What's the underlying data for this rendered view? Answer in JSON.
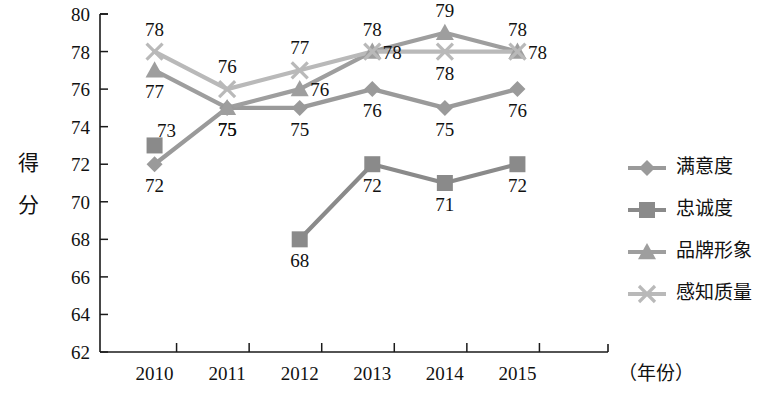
{
  "chart_data": {
    "type": "line",
    "title": "",
    "subtitle": "",
    "xlabel": "（年份）",
    "ylabel": "得分",
    "categories": [
      "2010",
      "2011",
      "2012",
      "2013",
      "2014",
      "2015"
    ],
    "ylim": [
      62,
      80
    ],
    "yticks": [
      62,
      64,
      66,
      68,
      70,
      72,
      74,
      76,
      78,
      80
    ],
    "ytick_labels": [
      "62",
      "64",
      "66",
      "68",
      "70",
      "72",
      "74",
      "76",
      "78",
      "80"
    ],
    "grid": false,
    "legend_position": "right",
    "series": [
      {
        "name": "满意度",
        "marker": "diamond",
        "color": "#9a9a9a",
        "values": [
          72,
          75,
          75,
          76,
          75,
          76
        ],
        "labels": [
          "72",
          "75",
          "75",
          "76",
          "75",
          "76"
        ]
      },
      {
        "name": "忠诚度",
        "marker": "square",
        "color": "#8a8a8a",
        "values": [
          73,
          null,
          68,
          72,
          71,
          72
        ],
        "labels": [
          "73",
          "",
          "68",
          "72",
          "71",
          "72"
        ]
      },
      {
        "name": "品牌形象",
        "marker": "triangle",
        "color": "#9e9e9e",
        "values": [
          77,
          75,
          76,
          78,
          79,
          78
        ],
        "labels": [
          "77",
          "75",
          "76",
          "78",
          "79",
          "78"
        ]
      },
      {
        "name": "感知质量",
        "marker": "cross",
        "color": "#b9b9b9",
        "values": [
          78,
          76,
          77,
          78,
          78,
          78
        ],
        "labels": [
          "78",
          "76",
          "77",
          "78",
          "78",
          "78"
        ]
      }
    ]
  },
  "axis": {
    "y_caption_chars": [
      "得",
      "分"
    ],
    "x_caption": "（年份）"
  },
  "legend": {
    "items": [
      {
        "label": "满意度",
        "marker": "diamond",
        "color": "#9a9a9a"
      },
      {
        "label": "忠诚度",
        "marker": "square",
        "color": "#8a8a8a"
      },
      {
        "label": "品牌形象",
        "marker": "triangle",
        "color": "#9e9e9e"
      },
      {
        "label": "感知质量",
        "marker": "cross",
        "color": "#b9b9b9"
      }
    ]
  }
}
